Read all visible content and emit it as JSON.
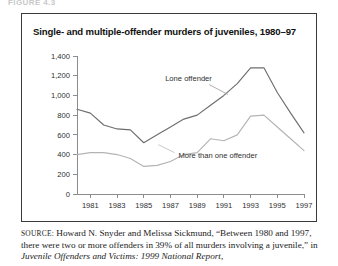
{
  "running_head": "FIGURE 4.3",
  "figure": {
    "title": "Single- and multiple-offender murders of juveniles, 1980–97"
  },
  "source": {
    "label": "SOURCE:",
    "text_before_italic": " Howard N. Snyder and Melissa Sickmund, “Between 1980 and 1997, there were two or more offenders in 39% of all murders involving a juvenile,” in ",
    "italic_title": "Juvenile Offenders and Victims: 1999 National Report,"
  },
  "annotations": {
    "lone_offender": "Lone offender",
    "more_than_one_offender": "More than one offender"
  },
  "chart_data": {
    "type": "line",
    "title": "Single- and multiple-offender murders of juveniles, 1980–97",
    "xlabel": "",
    "ylabel": "",
    "xlim": [
      1980,
      1997
    ],
    "ylim": [
      0,
      1400
    ],
    "ytick_values": [
      0,
      200,
      400,
      600,
      800,
      1000,
      1200,
      1400
    ],
    "ytick_labels": [
      "0",
      "200",
      "400",
      "600",
      "800",
      "1,000",
      "1,200",
      "1,400"
    ],
    "x": [
      1980,
      1981,
      1982,
      1983,
      1984,
      1985,
      1986,
      1987,
      1988,
      1989,
      1990,
      1991,
      1992,
      1993,
      1994,
      1995,
      1996,
      1997
    ],
    "xtick_values": [
      1981,
      1983,
      1985,
      1987,
      1989,
      1991,
      1993,
      1995,
      1997
    ],
    "xtick_labels": [
      "1981",
      "1983",
      "1985",
      "1987",
      "1989",
      "1991",
      "1993",
      "1995",
      "1997"
    ],
    "grid": false,
    "legend_position": "inline-annotation",
    "series": [
      {
        "name": "Lone offender",
        "color": "#6e6e6e",
        "values": [
          860,
          820,
          700,
          660,
          650,
          520,
          600,
          680,
          760,
          800,
          900,
          1000,
          1120,
          1280,
          1280,
          1030,
          820,
          620
        ]
      },
      {
        "name": "More than one offender",
        "color": "#b4b4b4",
        "values": [
          400,
          420,
          420,
          400,
          360,
          280,
          290,
          330,
          400,
          420,
          560,
          540,
          600,
          790,
          800,
          680,
          560,
          440
        ]
      }
    ]
  }
}
